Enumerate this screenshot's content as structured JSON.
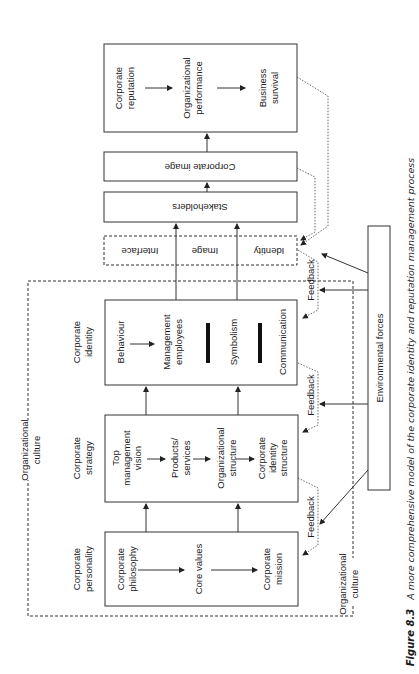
{
  "caption": {
    "figure_label": "Figure 8.3",
    "text": "A more comprehensive model of the corporate identity and reputation management process"
  },
  "outcomes": {
    "corporate_reputation": [
      "Corporate",
      "reputation"
    ],
    "organizational_performance": [
      "Organizational",
      "performance"
    ],
    "business_survival": [
      "Business",
      "survival"
    ]
  },
  "corporate_image": "Corporate image",
  "stakeholders": "Stakeholders",
  "interface_box": {
    "interface": "Interface",
    "image": "Image",
    "identity": "Identity"
  },
  "corporate_identity": {
    "heading": [
      "Corporate",
      "identity"
    ],
    "behaviour": "Behaviour",
    "management_employees": [
      "Management",
      "employees"
    ],
    "symbolism": "Symbolism",
    "communication": "Communication"
  },
  "corporate_strategy": {
    "heading": [
      "Corporate",
      "strategy"
    ],
    "top_management_vision": [
      "Top",
      "management",
      "vision"
    ],
    "products_services": [
      "Products/",
      "services"
    ],
    "organizational_structure": [
      "Organizational",
      "structure"
    ],
    "corporate_identity_structure": [
      "Corporate",
      "identity",
      "structure"
    ]
  },
  "corporate_personality": {
    "heading": [
      "Corporate",
      "personality"
    ],
    "corporate_philosophy": [
      "Corporate",
      "philosophy"
    ],
    "core_values": "Core values",
    "corporate_mission": [
      "Corporate",
      "mission"
    ]
  },
  "feedback_label": "Feedback",
  "environmental_forces": "Environmental forces",
  "organizational_culture": [
    "Organizational",
    "culture"
  ]
}
